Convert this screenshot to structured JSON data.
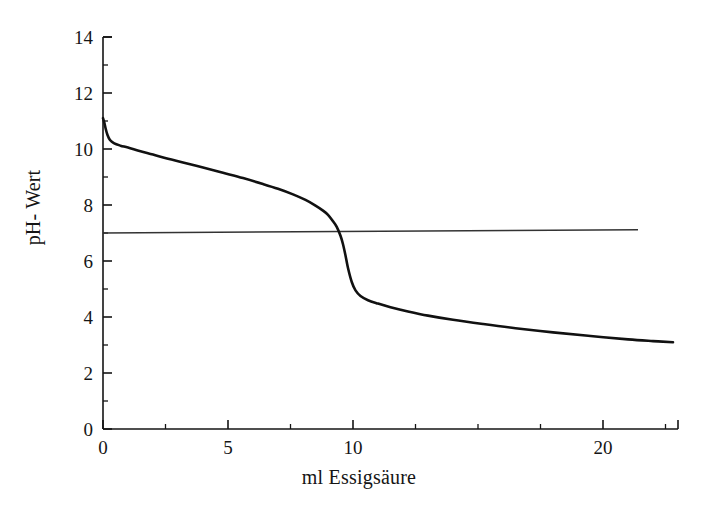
{
  "chart_data": {
    "type": "line",
    "title": "",
    "subtitle": "",
    "xlabel": "ml Essigsäure",
    "ylabel": "pH- Wert",
    "xlim": [
      0,
      23.0
    ],
    "ylim": [
      0,
      14
    ],
    "grid": false,
    "legend": null,
    "x_major_ticks": [
      0,
      5,
      10,
      20
    ],
    "x_major_tick_labels": [
      "0",
      "5",
      "10",
      "20"
    ],
    "x_minor_ticks": [
      2.5,
      7.5,
      12.5,
      15,
      17.5,
      22.5
    ],
    "y_major_ticks": [
      0,
      2,
      4,
      6,
      8,
      10,
      12,
      14
    ],
    "y_major_tick_labels": [
      "0",
      "2",
      "4",
      "6",
      "8",
      "10",
      "12",
      "14"
    ],
    "y_minor_ticks": [
      1,
      3,
      5,
      7,
      9,
      11,
      13
    ],
    "series": [
      {
        "name": "Titrationskurve",
        "kind": "line",
        "color": "#111111",
        "x": [
          0.0,
          0.05,
          0.1,
          0.18,
          0.28,
          0.45,
          0.7,
          1.0,
          1.5,
          2.0,
          2.6,
          3.2,
          4.0,
          4.8,
          5.6,
          6.4,
          7.0,
          7.6,
          8.1,
          8.5,
          8.8,
          9.0,
          9.2,
          9.35,
          9.5,
          9.6,
          9.7,
          9.8,
          9.95,
          10.1,
          10.3,
          10.6,
          11.0,
          11.5,
          12.2,
          13.0,
          14.0,
          15.2,
          16.5,
          18.0,
          19.5,
          21.0,
          22.0,
          22.8
        ],
        "y": [
          11.1,
          10.95,
          10.75,
          10.5,
          10.32,
          10.2,
          10.12,
          10.05,
          9.92,
          9.8,
          9.65,
          9.52,
          9.34,
          9.15,
          8.96,
          8.75,
          8.58,
          8.38,
          8.18,
          7.98,
          7.8,
          7.65,
          7.42,
          7.22,
          6.9,
          6.6,
          6.2,
          5.75,
          5.25,
          4.95,
          4.75,
          4.6,
          4.48,
          4.35,
          4.2,
          4.05,
          3.9,
          3.75,
          3.6,
          3.45,
          3.32,
          3.2,
          3.14,
          3.1
        ]
      },
      {
        "name": "Neutralpunkt-Linie",
        "kind": "line",
        "color": "#333333",
        "x": [
          0.0,
          21.4
        ],
        "y": [
          7.0,
          7.12
        ]
      }
    ],
    "annotations": [
      {
        "text": "Neutralpunkt pH 7",
        "value": 7.0
      },
      {
        "text": "Äquivalenzpunkt ca. 9,6 ml",
        "value": 9.6
      }
    ]
  },
  "axes": {
    "x_title": "ml Essigsäure",
    "y_title": "pH- Wert"
  },
  "x_labels": [
    {
      "value": 0,
      "text": "0"
    },
    {
      "value": 5,
      "text": "5"
    },
    {
      "value": 10,
      "text": "10"
    },
    {
      "value": 20,
      "text": "20"
    }
  ],
  "y_labels": [
    {
      "value": 0,
      "text": "0"
    },
    {
      "value": 2,
      "text": "2"
    },
    {
      "value": 4,
      "text": "4"
    },
    {
      "value": 6,
      "text": "6"
    },
    {
      "value": 8,
      "text": "8"
    },
    {
      "value": 10,
      "text": "10"
    },
    {
      "value": 12,
      "text": "12"
    },
    {
      "value": 14,
      "text": "14"
    }
  ],
  "colors": {
    "background": "#ffffff",
    "axis": "#151515",
    "curve": "#111111",
    "reference_line": "#333333",
    "text": "#151515"
  }
}
